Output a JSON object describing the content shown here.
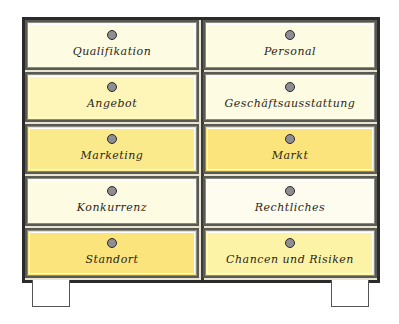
{
  "diagram": {
    "type": "drawer-cabinet",
    "drawers": [
      {
        "label": "Qualifikation",
        "row": 0,
        "col": 0,
        "color": "#fdfbe2"
      },
      {
        "label": "Personal",
        "row": 0,
        "col": 1,
        "color": "#fdfbe2"
      },
      {
        "label": "Angebot",
        "row": 1,
        "col": 0,
        "color": "#fdf6b8"
      },
      {
        "label": "Geschäftsausstattung",
        "row": 1,
        "col": 1,
        "color": "#fdfbe2"
      },
      {
        "label": "Marketing",
        "row": 2,
        "col": 0,
        "color": "#fbea8c"
      },
      {
        "label": "Markt",
        "row": 2,
        "col": 1,
        "color": "#fbe47c"
      },
      {
        "label": "Konkurrenz",
        "row": 3,
        "col": 0,
        "color": "#fdfbe2"
      },
      {
        "label": "Rechtliches",
        "row": 3,
        "col": 1,
        "color": "#fdfcef"
      },
      {
        "label": "Standort",
        "row": 4,
        "col": 0,
        "color": "#fbe47c"
      },
      {
        "label": "Chancen und Risiken",
        "row": 4,
        "col": 1,
        "color": "#fdf3a6"
      }
    ]
  }
}
